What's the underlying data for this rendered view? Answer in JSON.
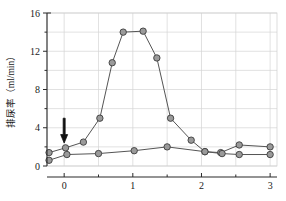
{
  "chart_data": {
    "type": "line",
    "title": "",
    "xlabel": "",
    "ylabel": "排尿率（ml/min）",
    "xlim": [
      -0.25,
      3.1
    ],
    "ylim": [
      0,
      16
    ],
    "grid": true,
    "legend_position": "none",
    "x_ticks_major": [
      0,
      1,
      2,
      3
    ],
    "x_tick_labels": [
      "0",
      "1",
      "2",
      "3"
    ],
    "x_ticks_minor": [
      0.5,
      1.5,
      2.5
    ],
    "y_ticks_major": [
      0,
      4,
      8,
      12,
      16
    ],
    "y_tick_labels": [
      "0",
      "4",
      "8",
      "12",
      "16"
    ],
    "y_ticks_minor": [
      2,
      6,
      10,
      14
    ],
    "annotations": [
      {
        "name": "injection-arrow",
        "symbol": "down-arrow",
        "x": 0.0,
        "y_tip": 2.4,
        "y_tail": 5.0,
        "label": ""
      }
    ],
    "series": [
      {
        "name": "实验组",
        "marker": "circle",
        "color": "#9a9a9a",
        "line_color": "#555555",
        "x": [
          -0.22,
          0.02,
          0.28,
          0.52,
          0.7,
          0.86,
          1.15,
          1.35,
          1.55,
          1.85,
          2.05,
          2.28,
          2.55,
          3.0
        ],
        "values": [
          1.4,
          1.9,
          2.5,
          5.0,
          10.8,
          14.0,
          14.1,
          11.3,
          5.0,
          2.7,
          1.5,
          1.4,
          2.2,
          2.0
        ]
      },
      {
        "name": "对照组",
        "marker": "circle",
        "color": "#9a9a9a",
        "line_color": "#555555",
        "x": [
          -0.22,
          0.04,
          0.5,
          1.02,
          1.5,
          2.05,
          2.3,
          2.55,
          3.0
        ],
        "values": [
          0.6,
          1.2,
          1.3,
          1.6,
          2.0,
          1.5,
          1.3,
          1.2,
          1.2
        ]
      }
    ]
  }
}
